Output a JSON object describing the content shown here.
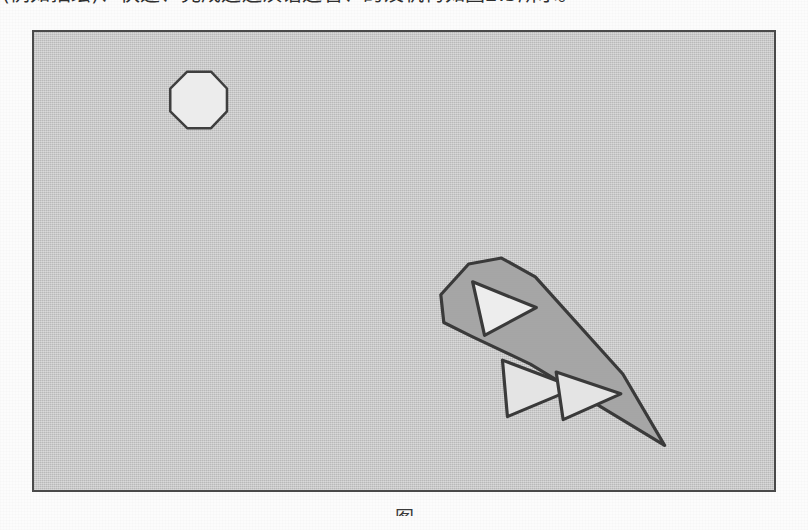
{
  "document": {
    "body_text_above": "(例如描绘)、快速、完成运送汉语运管、的及机构如图2.5所示。",
    "caption": "图"
  },
  "figure": {
    "name": "grayscale-shape-figure",
    "frame": {
      "x": 32,
      "y": 30,
      "width": 744,
      "height": 462
    },
    "background_color": "#c3c3c3",
    "border_color": "#4a4a4a"
  },
  "shapes": {
    "octagon": {
      "label": "octagon",
      "fill": "#ececec",
      "stroke": "#3f3f3f",
      "stroke_width": 2,
      "points": "137,57 154,40 178,40 194,57 194,80 178,97 154,97 137,80"
    },
    "polygon": {
      "label": "elongated-polygon",
      "fill": "#a3a3a3",
      "stroke": "#3a3a3a",
      "stroke_width": 3,
      "points": "409,265 438,235 470,228 500,243 570,307 633,417 108,0"
    },
    "polygon_points": "409,265 437,234 470,228 504,247 592,345 634,417 499,335 440,307 412,293",
    "triangles": [
      {
        "label": "triangle-upper-left",
        "fill": "#ededed",
        "stroke": "#3a3a3a",
        "stroke_width": 3,
        "points": "441,252 505,278 453,306"
      },
      {
        "label": "triangle-middle",
        "fill": "#e4e4e4",
        "stroke": "#3a3a3a",
        "stroke_width": 3,
        "points": "471,331 545,359 476,388"
      },
      {
        "label": "triangle-right",
        "fill": "#e4e4e4",
        "stroke": "#3a3a3a",
        "stroke_width": 3,
        "points": "525,343 590,365 532,391"
      }
    ]
  }
}
